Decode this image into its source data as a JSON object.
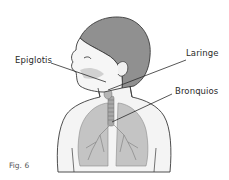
{
  "figure": {
    "caption": "Fig. 6",
    "labels": [
      {
        "id": "epiglotis",
        "text": "Epiglotis"
      },
      {
        "id": "laringe",
        "text": "Laringe"
      },
      {
        "id": "bronquios",
        "text": "Bronquios"
      }
    ]
  },
  "colors": {
    "outline": "#3a3a3a",
    "hair": "#8f8f8f",
    "skin": "#f2f2f2",
    "lung": "#bdbdbd",
    "airway": "#9a9a9a"
  }
}
